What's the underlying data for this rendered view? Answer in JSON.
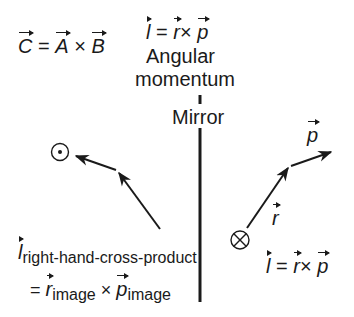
{
  "equations": {
    "general_cross": {
      "lhs": "C",
      "eq": " = ",
      "a": "A",
      "op": " × ",
      "b": "B"
    },
    "angular_def": {
      "lhs": "l",
      "eq": " = ",
      "a": "r",
      "op": "× ",
      "b": "p"
    },
    "right_side": {
      "lhs": "l",
      "eq": " = ",
      "a": "r",
      "op": "× ",
      "b": "p"
    }
  },
  "labels": {
    "angular": "Angular",
    "momentum": "momentum",
    "mirror": "Mirror",
    "p_vector": "p",
    "r_vector": "r"
  },
  "left_label": {
    "l": "l",
    "l_sub": "right-hand-cross-product",
    "eq": "= ",
    "r": "r",
    "r_sub": "image",
    "op": " × ",
    "p": "p",
    "p_sub": "image"
  },
  "symbols": {
    "out_of_page": "dot-in-circle",
    "into_page": "cross-in-circle"
  },
  "colors": {
    "ink": "#1a1a1a",
    "background": "#ffffff"
  }
}
